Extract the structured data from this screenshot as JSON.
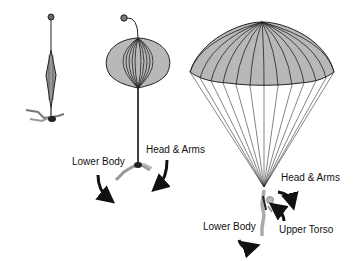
{
  "diagram": {
    "stages": [
      {
        "id": "stage-1",
        "description": "Pilot chute with canopy in bag / streamer"
      },
      {
        "id": "stage-2",
        "description": "Canopy inflating (line stretch)"
      },
      {
        "id": "stage-3",
        "description": "Fully inflated canopy"
      }
    ],
    "labels": {
      "stage2_lower_body": "Lower Body",
      "stage2_head_arms": "Head & Arms",
      "stage3_head_arms": "Head & Arms",
      "stage3_lower_body": "Lower Body",
      "stage3_upper_torso": "Upper Torso"
    },
    "colors": {
      "canopy_fill": "#b8b8b8",
      "line": "#222222",
      "arrow": "#111111",
      "background": "#ffffff"
    }
  }
}
